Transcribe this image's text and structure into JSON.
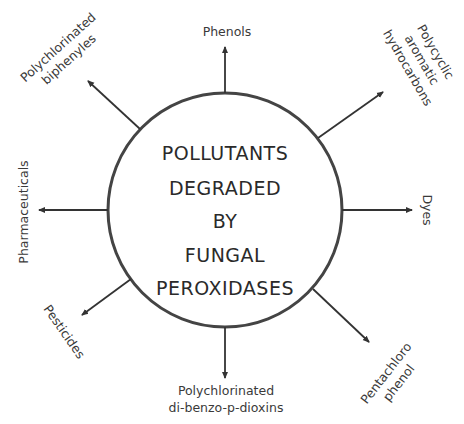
{
  "diagram": {
    "center": {
      "lines": [
        "POLLUTANTS",
        "DEGRADED",
        "BY",
        "FUNGAL",
        "PEROXIDASES"
      ]
    },
    "pollutants": [
      {
        "id": "phenols",
        "lines": [
          "Phenols"
        ]
      },
      {
        "id": "pah",
        "lines": [
          "Polycyclic",
          "aromatic",
          "hydrocarbons"
        ]
      },
      {
        "id": "dyes",
        "lines": [
          "Dyes"
        ]
      },
      {
        "id": "pcp",
        "lines": [
          "Pentachloro",
          "phenol"
        ]
      },
      {
        "id": "pcdd",
        "lines": [
          "Polychlorinated",
          "di-benzo-p-dioxins"
        ]
      },
      {
        "id": "pesticides",
        "lines": [
          "Pesticides"
        ]
      },
      {
        "id": "pharmaceuticals",
        "lines": [
          "Pharmaceuticals"
        ]
      },
      {
        "id": "pcb",
        "lines": [
          "Polychlorinated",
          "biphenyles"
        ]
      }
    ],
    "colors": {
      "stroke": "#333333",
      "text": "#3a3a3a"
    }
  }
}
